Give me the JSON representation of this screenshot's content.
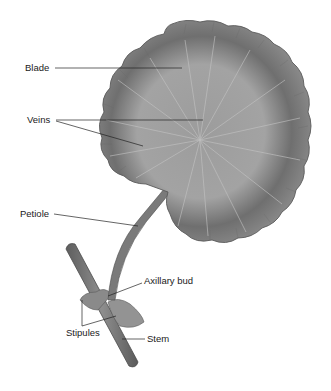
{
  "diagram": {
    "labels": {
      "blade": "Blade",
      "veins": "Veins",
      "petiole": "Petiole",
      "axillary_bud": "Axillary bud",
      "stipules": "Stipules",
      "stem": "Stem"
    },
    "colors": {
      "background": "#ffffff",
      "leaf_dark": "#6e6e6e",
      "leaf_mid": "#8a8a8a",
      "leaf_light": "#a8a8a8",
      "leader_line": "#222222",
      "text": "#1a1a1a"
    }
  }
}
